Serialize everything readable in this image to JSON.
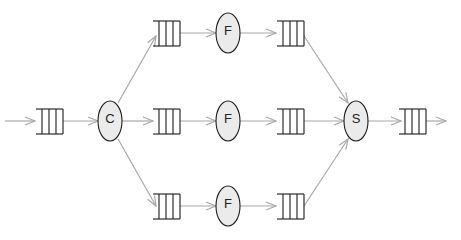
{
  "diagram": {
    "colors": {
      "edge": "#a8a8a8",
      "node_fill": "#ebebeb",
      "stroke": "#1a1a1a"
    },
    "nodes": [
      {
        "id": "C",
        "label": "C",
        "type": "splitter"
      },
      {
        "id": "F1",
        "label": "F",
        "type": "worker"
      },
      {
        "id": "F2",
        "label": "F",
        "type": "worker"
      },
      {
        "id": "F3",
        "label": "F",
        "type": "worker"
      },
      {
        "id": "S",
        "label": "S",
        "type": "merger"
      }
    ],
    "queues": [
      {
        "id": "q_in",
        "role": "input"
      },
      {
        "id": "q_f1_in",
        "role": "worker-input"
      },
      {
        "id": "q_f2_in",
        "role": "worker-input"
      },
      {
        "id": "q_f3_in",
        "role": "worker-input"
      },
      {
        "id": "q_f1_out",
        "role": "worker-output"
      },
      {
        "id": "q_f2_out",
        "role": "worker-output"
      },
      {
        "id": "q_f3_out",
        "role": "worker-output"
      },
      {
        "id": "q_out",
        "role": "output"
      }
    ]
  }
}
